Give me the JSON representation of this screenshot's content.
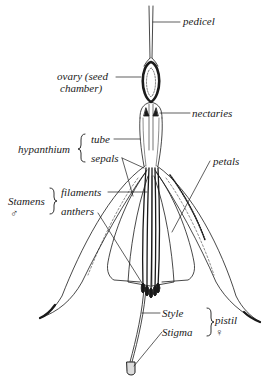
{
  "diagram": {
    "labels": {
      "pedicel": "pedicel",
      "ovary_line1": "ovary (seed",
      "ovary_line2": "chamber)",
      "nectaries": "nectaries",
      "hypanthium": "hypanthium",
      "tube": "tube",
      "sepals": "sepals",
      "petals": "petals",
      "stamens": "Stamens",
      "stamens_symbol": "♂",
      "filaments": "filaments",
      "anthers": "anthers",
      "style": "Style",
      "stigma": "Stigma",
      "pistil": "pistil",
      "pistil_symbol": "♀"
    },
    "groups": [
      {
        "name": "hypanthium",
        "members": [
          "tube",
          "sepals"
        ]
      },
      {
        "name": "Stamens",
        "members": [
          "filaments",
          "anthers"
        ]
      },
      {
        "name": "pistil",
        "members": [
          "Style",
          "Stigma"
        ]
      }
    ],
    "colors": {
      "ink": "#1a1a1a",
      "background": "#ffffff"
    }
  }
}
